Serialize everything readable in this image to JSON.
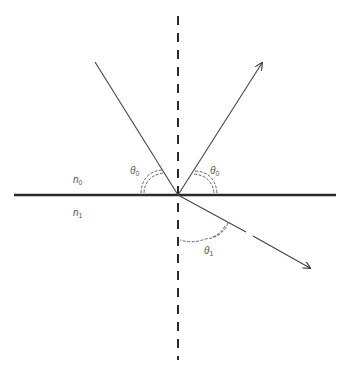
{
  "diagram": {
    "title": "",
    "media": {
      "upper": {
        "symbol": "n",
        "subscript": "0"
      },
      "lower": {
        "symbol": "n",
        "subscript": "1"
      }
    },
    "angles": {
      "incident": {
        "symbol": "θ",
        "subscript": "0"
      },
      "reflected": {
        "symbol": "θ",
        "subscript": "0"
      },
      "refracted": {
        "symbol": "θ",
        "subscript": "1"
      }
    },
    "elements": {
      "normal": "dashed vertical normal line",
      "interface": "boundary between media",
      "incident_ray": "incident ray",
      "reflected_ray": "reflected ray",
      "refracted_ray": "refracted ray"
    },
    "colors": {
      "line": "#333333",
      "interface": "#2a2a2a",
      "label": "#555555"
    }
  }
}
